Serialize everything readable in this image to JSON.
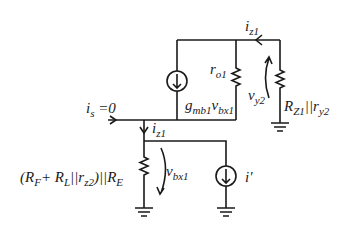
{
  "diagram": {
    "type": "small-signal circuit schematic",
    "labels": {
      "iz1_top": {
        "main": "i",
        "sub": "z1"
      },
      "ro1": {
        "main": "r",
        "sub": "o1"
      },
      "gm": {
        "main": "g",
        "sub": "mb1",
        "main2": "v",
        "sub2": "bx1"
      },
      "vy2": {
        "main": "v",
        "sub": "y2"
      },
      "rz1": {
        "main": "R",
        "sub": "Z1",
        "mid": "||",
        "main2": "r",
        "sub2": "y2"
      },
      "is": {
        "main": "i",
        "sub": "s",
        "tail": " =0"
      },
      "iz1_mid": {
        "main": "i",
        "sub": "z1"
      },
      "vbx1": {
        "main": "v",
        "sub": "bx1"
      },
      "iprime": {
        "text": "i'"
      },
      "req": {
        "p1": "(R",
        "s1": "F",
        "p2": "+ R",
        "s2": "L",
        "p3": "||r",
        "s3": "z2",
        "p4": ")||R",
        "s4": "E"
      }
    },
    "colors": {
      "line": "#1a1a1a",
      "background": "#ffffff"
    }
  }
}
